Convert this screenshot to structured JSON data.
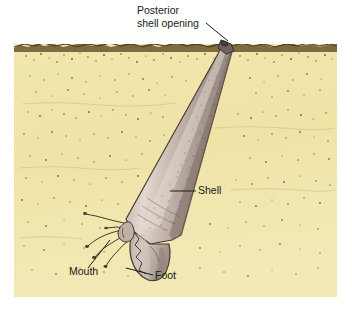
{
  "figure": {
    "type": "biological-illustration",
    "canvas": {
      "width": 352,
      "height": 309
    },
    "background_color": "#ffffff"
  },
  "scene": {
    "sediment": {
      "name": "sand substrate",
      "fill_color": "#efe3a8",
      "fill_color_light": "#f5ecc0",
      "surface_line_color": "#5a4526",
      "speckle_color": "#3a2d18",
      "bounds": {
        "x": 14,
        "y": 42,
        "width": 323,
        "height": 255
      }
    },
    "animal": {
      "name": "tusk shell",
      "shell_fill": "#b6a8a0",
      "shell_highlight": "#ded4cc",
      "shell_shadow": "#8a7a74",
      "outline_color": "#4a3b33",
      "foot_fill": "#c4b6ad",
      "tentacle_color": "#4a3b33"
    }
  },
  "labels": [
    {
      "id": "posterior-shell-opening",
      "line1": "Posterior",
      "line2": "shell opening",
      "text_x": 137,
      "text_y": 14,
      "leader": {
        "x1": 206,
        "y1": 23,
        "x2": 228,
        "y2": 41
      }
    },
    {
      "id": "shell",
      "line1": "Shell",
      "line2": "",
      "text_x": 198,
      "text_y": 194,
      "leader": {
        "x1": 196,
        "y1": 191,
        "x2": 170,
        "y2": 191
      }
    },
    {
      "id": "mouth",
      "line1": "Mouth",
      "line2": "",
      "text_x": 69,
      "text_y": 275,
      "leader": {
        "x1": 88,
        "y1": 268,
        "x2": 110,
        "y2": 240
      }
    },
    {
      "id": "foot",
      "line1": "Foot",
      "line2": "",
      "text_x": 155,
      "text_y": 279,
      "leader": {
        "x1": 153,
        "y1": 275,
        "x2": 126,
        "y2": 268
      }
    }
  ]
}
